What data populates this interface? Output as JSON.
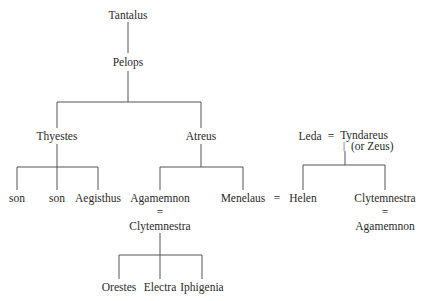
{
  "diagram": {
    "type": "family-tree",
    "nodes": {
      "tantalus": "Tantalus",
      "pelops": "Pelops",
      "thyestes": "Thyestes",
      "atreus": "Atreus",
      "son1": "son",
      "son2": "son",
      "aegisthus": "Aegisthus",
      "agamemnon": "Agamemnon",
      "agamemnon_spouse": "Clytemnestra",
      "menelaus": "Menelaus",
      "helen": "Helen",
      "leda": "Leda",
      "tyndareus": "Tyndareus",
      "tyndareus_note": "(or Zeus)",
      "clytemnestra": "Clytemnestra",
      "clytemnestra_spouse": "Agamemnon",
      "orestes": "Orestes",
      "electra": "Electra",
      "iphigenia": "Iphigenia"
    },
    "marriage_symbol": "=",
    "pipe_symbol": "|",
    "line_color": "#555555"
  }
}
